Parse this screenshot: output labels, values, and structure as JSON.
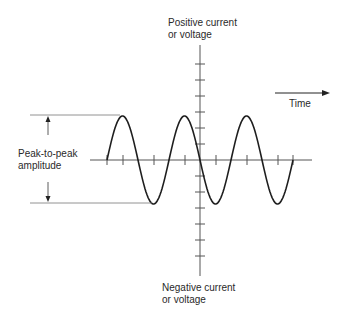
{
  "labels": {
    "positive": [
      "Positive current",
      "or voltage"
    ],
    "negative": [
      "Negative current",
      "or voltage"
    ],
    "time": "Time",
    "amplitude": [
      "Peak-to-peak",
      "amplitude"
    ]
  },
  "colors": {
    "line": "#1e1e1e",
    "axis": "#555555",
    "guide": "#777777"
  }
}
